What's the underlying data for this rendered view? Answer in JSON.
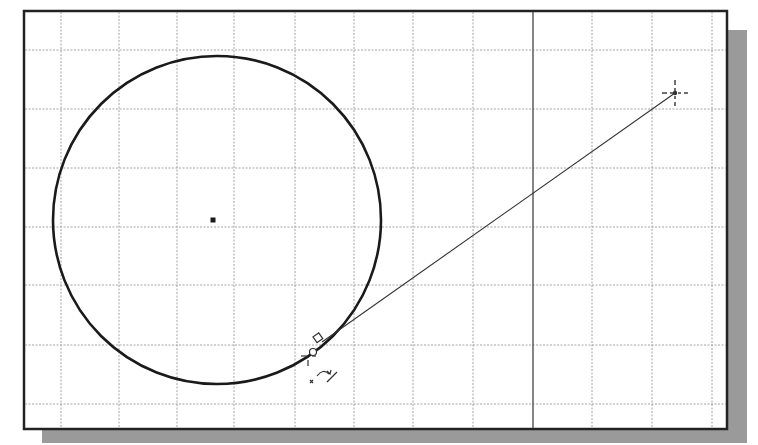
{
  "viewport": {
    "frame": {
      "x": 24,
      "y": 11,
      "width": 703,
      "height": 418,
      "border_color": "#222222",
      "background": "#ffffff"
    },
    "shadow_color": "#9a9a9a",
    "grid": {
      "color": "#9a9a9a",
      "vertical_lines": [
        61,
        119,
        177,
        234,
        295,
        354,
        413,
        473,
        533,
        592,
        652,
        712
      ],
      "horizontal_lines": [
        50,
        109,
        168,
        227,
        285,
        345,
        404
      ],
      "axis_line_x": 533,
      "axis_color": "#444444"
    }
  },
  "sketch": {
    "circle": {
      "cx": 217,
      "cy": 220,
      "r": 164,
      "stroke": "#1a1a1a",
      "stroke_width": 2.6
    },
    "center_point": {
      "x": 213,
      "y": 220,
      "size": 5
    },
    "tangent_line": {
      "x1": 322,
      "y1": 342,
      "x2": 675,
      "y2": 93,
      "stroke": "#333333"
    },
    "endpoint_cursor": {
      "x": 675,
      "y": 93
    },
    "tangent_constraint_marker": {
      "x": 318,
      "y": 340
    },
    "cursor": {
      "x": 311,
      "y": 352
    }
  }
}
